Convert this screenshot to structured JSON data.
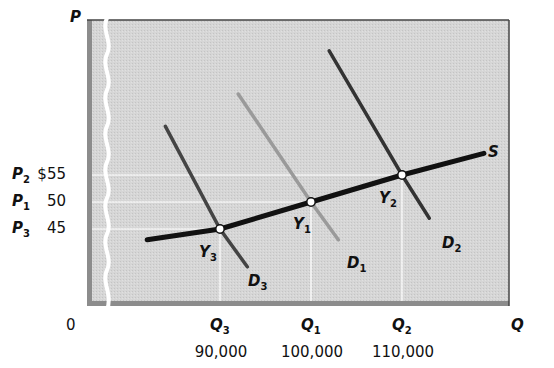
{
  "chart_data": {
    "type": "line",
    "title": "",
    "xlabel": "Q",
    "ylabel": "P",
    "origin_label": "0",
    "axis_break": true,
    "grid": "reference lines to equilibrium points only",
    "y_ticks": [
      {
        "symbol": "P",
        "subscript": "2",
        "value_label": "$55",
        "value": 55
      },
      {
        "symbol": "P",
        "subscript": "1",
        "value_label": "50",
        "value": 50
      },
      {
        "symbol": "P",
        "subscript": "3",
        "value_label": "45",
        "value": 45
      }
    ],
    "x_ticks": [
      {
        "symbol": "Q",
        "subscript": "3",
        "value_label": "90,000",
        "value": 90000
      },
      {
        "symbol": "Q",
        "subscript": "1",
        "value_label": "100,000",
        "value": 100000
      },
      {
        "symbol": "Q",
        "subscript": "2",
        "value_label": "110,000",
        "value": 110000
      }
    ],
    "series": [
      {
        "name": "S",
        "label": "S",
        "kind": "supply",
        "color": "#111111",
        "points": [
          {
            "q": 82000,
            "p": 43
          },
          {
            "q": 90000,
            "p": 45
          },
          {
            "q": 100000,
            "p": 50
          },
          {
            "q": 110000,
            "p": 55
          },
          {
            "q": 119000,
            "p": 59
          }
        ]
      },
      {
        "name": "D1",
        "label": "D",
        "subscript": "1",
        "kind": "demand",
        "color": "#9a9a9a",
        "points": [
          {
            "q": 92000,
            "p": 70
          },
          {
            "q": 100000,
            "p": 50
          },
          {
            "q": 103000,
            "p": 43
          }
        ]
      },
      {
        "name": "D2",
        "label": "D",
        "subscript": "2",
        "kind": "demand",
        "color": "#333333",
        "points": [
          {
            "q": 102000,
            "p": 78
          },
          {
            "q": 110000,
            "p": 55
          },
          {
            "q": 113000,
            "p": 47
          }
        ]
      },
      {
        "name": "D3",
        "label": "D",
        "subscript": "3",
        "kind": "demand",
        "color": "#444444",
        "points": [
          {
            "q": 84000,
            "p": 64
          },
          {
            "q": 90000,
            "p": 45
          },
          {
            "q": 93000,
            "p": 38
          }
        ]
      }
    ],
    "equilibria": [
      {
        "label": "Y",
        "subscript": "1",
        "q": 100000,
        "p": 50
      },
      {
        "label": "Y",
        "subscript": "2",
        "q": 110000,
        "p": 55
      },
      {
        "label": "Y",
        "subscript": "3",
        "q": 90000,
        "p": 45
      }
    ],
    "colors": {
      "panel": "#d4d4d4",
      "panel_border": "#555555",
      "shadow": "#8c8c8c",
      "reference_lines": "#ffffff"
    }
  }
}
